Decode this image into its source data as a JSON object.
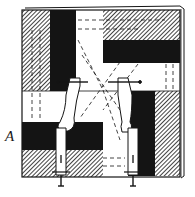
{
  "figure": {
    "label": "A",
    "colors": {
      "ink": "#141414",
      "paper": "#ffffff",
      "hatch": "#141414"
    }
  }
}
